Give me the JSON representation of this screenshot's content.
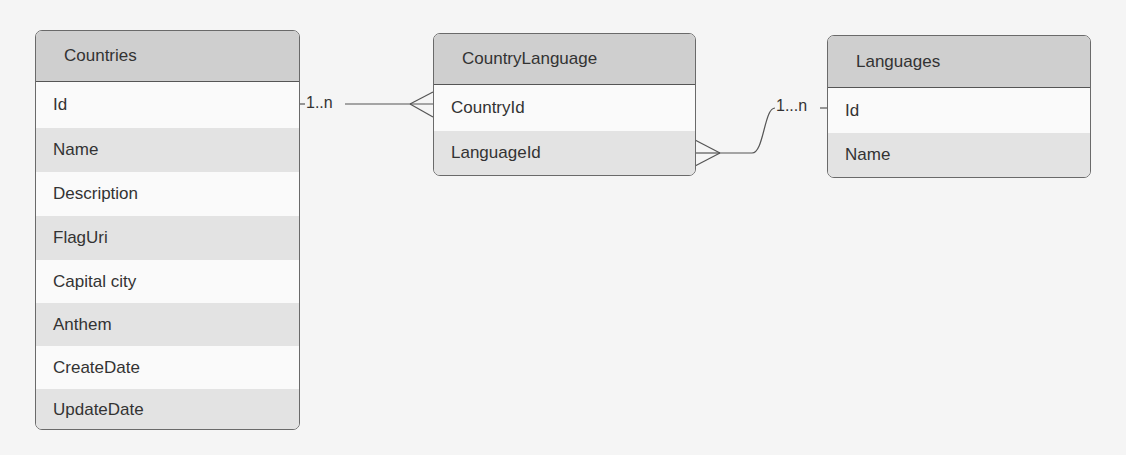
{
  "entities": {
    "countries": {
      "title": "Countries",
      "fields": [
        "Id",
        "Name",
        "Description",
        "FlagUri",
        "Capital city",
        "Anthem",
        "CreateDate",
        "UpdateDate"
      ]
    },
    "country_language": {
      "title": "CountryLanguage",
      "fields": [
        "CountryId",
        "LanguageId"
      ]
    },
    "languages": {
      "title": "Languages",
      "fields": [
        "Id",
        "Name"
      ]
    }
  },
  "relationships": [
    {
      "from": "Countries.Id",
      "to": "CountryLanguage.CountryId",
      "label": "1..n"
    },
    {
      "from": "CountryLanguage.LanguageId",
      "to": "Languages.Id",
      "label": "1...n"
    }
  ],
  "colors": {
    "header": "#cfcfcf",
    "alt_row": "#e3e3e3",
    "row": "#fafafa",
    "border": "#6a6a6a",
    "text": "#333333"
  }
}
